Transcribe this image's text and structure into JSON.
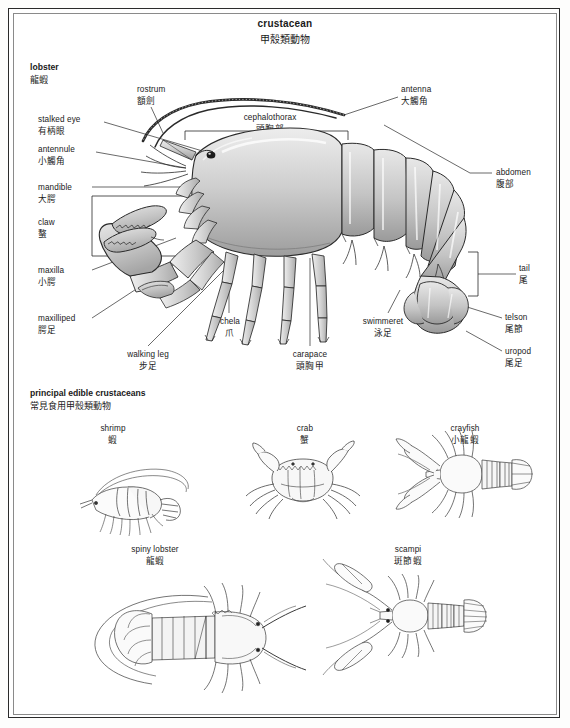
{
  "title": {
    "en": "crustacean",
    "zh": "甲殼類動物"
  },
  "sections": {
    "lobster": {
      "en": "lobster",
      "zh": "龍蝦"
    },
    "edible": {
      "en": "principal edible crustaceans",
      "zh": "常見食用甲殼類動物"
    }
  },
  "labels": {
    "rostrum": {
      "en": "rostrum",
      "zh": "額劍"
    },
    "antenna": {
      "en": "antenna",
      "zh": "大觸角"
    },
    "cephalothorax": {
      "en": "cephalothorax",
      "zh": "頭胸部"
    },
    "stalked_eye": {
      "en": "stalked eye",
      "zh": "有柄眼"
    },
    "antennule": {
      "en": "antennule",
      "zh": "小觸角"
    },
    "mandible": {
      "en": "mandible",
      "zh": "大腭"
    },
    "claw": {
      "en": "claw",
      "zh": "螯"
    },
    "maxilla": {
      "en": "maxilla",
      "zh": "小腭"
    },
    "maxilliped": {
      "en": "maxilliped",
      "zh": "腭足"
    },
    "walking_leg": {
      "en": "walking leg",
      "zh": "步足"
    },
    "chela": {
      "en": "chela",
      "zh": "爪"
    },
    "carapace": {
      "en": "carapace",
      "zh": "頭胸甲"
    },
    "swimmeret": {
      "en": "swimmeret",
      "zh": "泳足"
    },
    "abdomen": {
      "en": "abdomen",
      "zh": "腹部"
    },
    "tail": {
      "en": "tail",
      "zh": "尾"
    },
    "telson": {
      "en": "telson",
      "zh": "尾節"
    },
    "uropod": {
      "en": "uropod",
      "zh": "尾足"
    }
  },
  "specimens": [
    {
      "id": "shrimp",
      "en": "shrimp",
      "zh": "蝦"
    },
    {
      "id": "crab",
      "en": "crab",
      "zh": "蟹"
    },
    {
      "id": "crayfish",
      "en": "crayfish",
      "zh": "小龍蝦"
    },
    {
      "id": "spiny_lobster",
      "en": "spiny lobster",
      "zh": "龍蝦"
    },
    {
      "id": "scampi",
      "en": "scampi",
      "zh": "斑節蝦"
    }
  ],
  "colors": {
    "ink": "#1a1a1a",
    "shell_fill": "#c9c9c9",
    "shell_light": "#e3e3e3",
    "line": "#2a2a2a",
    "page": "#ffffff"
  }
}
